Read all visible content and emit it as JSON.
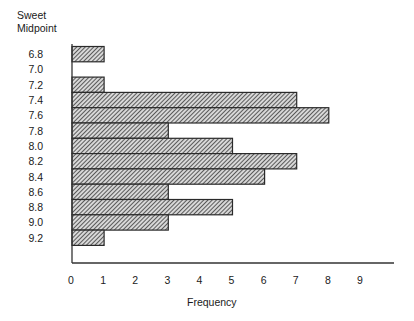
{
  "chart_data": {
    "type": "bar",
    "orientation": "horizontal",
    "title": "",
    "ylabel_lines": [
      "Sweet",
      "Midpoint"
    ],
    "ylabel": "Sweet Midpoint",
    "xlabel": "Frequency",
    "categories": [
      "6.8",
      "7.0",
      "7.2",
      "7.4",
      "7.6",
      "7.8",
      "8.0",
      "8.2",
      "8.4",
      "8.6",
      "8.8",
      "9.0",
      "9.2"
    ],
    "values": [
      1,
      0,
      1,
      7,
      8,
      3,
      5,
      7,
      6,
      3,
      5,
      3,
      1
    ],
    "xticks": [
      "0",
      "1",
      "2",
      "3",
      "4",
      "5",
      "6",
      "7",
      "8",
      "9"
    ],
    "xlim": [
      0,
      10
    ],
    "grid": false,
    "legend": null,
    "bar_fill": "diagonal-hatch",
    "colors": {
      "bar_stroke": "#2a2a2a",
      "hatch": "#3a3a3a",
      "axis": "#333333",
      "text": "#1a1a1a"
    }
  }
}
